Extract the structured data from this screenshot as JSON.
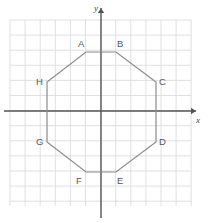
{
  "figure": {
    "canvas": {
      "width": 214,
      "height": 223
    },
    "colors": {
      "background": "#ffffff",
      "grid": "#dcdcdc",
      "axis": "#555555",
      "shape_stroke": "#8a8a8a",
      "label_text": "#555555",
      "axis_label_text": "#444444"
    },
    "grid": {
      "visible": true,
      "spacing_px": 15.1,
      "x_start": 10,
      "x_end": 191,
      "y_start": 20,
      "y_end": 206,
      "columns": 12,
      "rows": 12
    },
    "axes": {
      "origin_px": {
        "x": 101,
        "y": 111
      },
      "x_axis": {
        "label": "x",
        "from_px": {
          "x": 4,
          "y": 111
        },
        "to_px": {
          "x": 196,
          "y": 111
        },
        "arrow": "right",
        "label_px": {
          "x": 196,
          "y": 123
        }
      },
      "y_axis": {
        "label": "y",
        "from_px": {
          "x": 101,
          "y": 218
        },
        "to_px": {
          "x": 101,
          "y": 8
        },
        "arrow": "up",
        "label_px": {
          "x": 94,
          "y": 11
        }
      }
    },
    "shape": {
      "name": "octagon",
      "sides": 8,
      "closed": true,
      "vertices": [
        {
          "label": "A",
          "x": 86,
          "y": 52,
          "label_x": 78,
          "label_y": 47
        },
        {
          "label": "B",
          "x": 116,
          "y": 52,
          "label_x": 117,
          "label_y": 47
        },
        {
          "label": "C",
          "x": 156,
          "y": 82,
          "label_x": 159,
          "label_y": 85
        },
        {
          "label": "D",
          "x": 156,
          "y": 142,
          "label_x": 159,
          "label_y": 145
        },
        {
          "label": "E",
          "x": 116,
          "y": 172,
          "label_x": 117,
          "label_y": 184
        },
        {
          "label": "F",
          "x": 86,
          "y": 172,
          "label_x": 76,
          "label_y": 184
        },
        {
          "label": "G",
          "x": 47,
          "y": 142,
          "label_x": 36,
          "label_y": 145
        },
        {
          "label": "H",
          "x": 47,
          "y": 82,
          "label_x": 36,
          "label_y": 85
        }
      ]
    }
  }
}
